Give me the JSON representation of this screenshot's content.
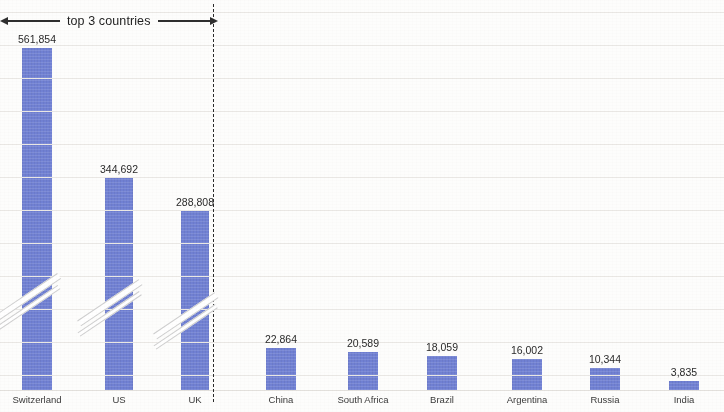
{
  "annotation": {
    "top3_label": "top 3 countries",
    "left_arrow_icon": "arrow-left-icon",
    "right_arrow_icon": "arrow-right-icon",
    "divider_icon": "vertical-dashed-divider"
  },
  "chart_data": {
    "type": "bar",
    "title": "",
    "subtitle": "",
    "xlabel": "",
    "ylabel": "",
    "grid": true,
    "legend": null,
    "bar_color": "#7181d4",
    "broken_axis": true,
    "broken_axis_note": "Top 3 bars are drawn with an axis-break (double diagonal slash) because their values are an order of magnitude larger than the rest.",
    "categories": [
      "Switzerland",
      "US",
      "UK",
      "China",
      "South Africa",
      "Brazil",
      "Argentina",
      "Russia",
      "India"
    ],
    "values": [
      561854,
      344692,
      288808,
      22864,
      20589,
      18059,
      16002,
      10344,
      3835
    ],
    "value_labels": [
      "561,854",
      "344,692",
      "288,808",
      "22,864",
      "20,589",
      "18,059",
      "16,002",
      "10,344",
      "3,835"
    ],
    "groups": [
      {
        "name": "top 3 countries",
        "categories": [
          "Switzerland",
          "US",
          "UK"
        ]
      },
      {
        "name": "remaining countries",
        "categories": [
          "China",
          "South Africa",
          "Brazil",
          "Argentina",
          "Russia",
          "India"
        ]
      }
    ],
    "bars": [
      {
        "label": "Switzerland",
        "value": 561854,
        "value_label": "561,854",
        "x": 22,
        "width": 30,
        "top": 48,
        "broken": true,
        "break_y": 285
      },
      {
        "label": "US",
        "value": 344692,
        "value_label": "344,692",
        "x": 105,
        "width": 28,
        "top": 178,
        "broken": true,
        "break_y": 290
      },
      {
        "label": "UK",
        "value": 288808,
        "value_label": "288,808",
        "x": 181,
        "width": 28,
        "top": 211,
        "broken": true,
        "break_y": 303
      },
      {
        "label": "China",
        "value": 22864,
        "value_label": "22,864",
        "x": 266,
        "width": 30,
        "top": 348,
        "broken": false,
        "break_y": 0
      },
      {
        "label": "South Africa",
        "value": 20589,
        "value_label": "20,589",
        "x": 348,
        "width": 30,
        "top": 352,
        "broken": false,
        "break_y": 0
      },
      {
        "label": "Brazil",
        "value": 18059,
        "value_label": "18,059",
        "x": 427,
        "width": 30,
        "top": 356,
        "broken": false,
        "break_y": 0
      },
      {
        "label": "Argentina",
        "value": 16002,
        "value_label": "16,002",
        "x": 512,
        "width": 30,
        "top": 359,
        "broken": false,
        "break_y": 0
      },
      {
        "label": "Russia",
        "value": 10344,
        "value_label": "10,344",
        "x": 590,
        "width": 30,
        "top": 368,
        "broken": false,
        "break_y": 0
      },
      {
        "label": "India",
        "value": 3835,
        "value_label": "3,835",
        "x": 669,
        "width": 30,
        "top": 381,
        "broken": false,
        "break_y": 0
      }
    ],
    "gridline_y": [
      12,
      45,
      78,
      111,
      144,
      177,
      210,
      243,
      276,
      309,
      342,
      375
    ],
    "baseline_y": 390,
    "divider_x": 213
  }
}
